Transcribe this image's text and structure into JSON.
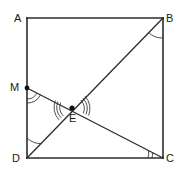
{
  "figure": {
    "kind": "plane-geometry-diagram",
    "shape": "square",
    "canvas": {
      "width": 179,
      "height": 175,
      "background": "#ffffff"
    },
    "stroke_color": "#2b2b2b",
    "arc_color": "#3a3a3a",
    "label_color": "#1a1a1a",
    "points": [
      {
        "id": "A",
        "label": "A",
        "x": 27,
        "y": 18,
        "label_x": 14,
        "label_y": 22,
        "marker": false
      },
      {
        "id": "B",
        "label": "B",
        "x": 163,
        "y": 18,
        "label_x": 166,
        "label_y": 22,
        "marker": false
      },
      {
        "id": "C",
        "label": "C",
        "x": 163,
        "y": 158,
        "label_x": 166,
        "label_y": 162,
        "marker": false
      },
      {
        "id": "D",
        "label": "D",
        "x": 27,
        "y": 158,
        "label_x": 12,
        "label_y": 162,
        "marker": false
      },
      {
        "id": "M",
        "label": "M",
        "x": 27,
        "y": 88,
        "label_x": 10,
        "label_y": 91,
        "marker": true
      },
      {
        "id": "E",
        "label": "E",
        "x": 72,
        "y": 108,
        "label_x": 69,
        "label_y": 122,
        "marker": true
      }
    ],
    "square_sides": [
      {
        "id": "AB",
        "from": "A",
        "to": "B"
      },
      {
        "id": "BC",
        "from": "B",
        "to": "C"
      },
      {
        "id": "CD",
        "from": "C",
        "to": "D"
      },
      {
        "id": "DA",
        "from": "D",
        "to": "A"
      }
    ],
    "segments": [
      {
        "id": "BD",
        "from": "B",
        "to": "D",
        "note": "diagonal"
      },
      {
        "id": "MC",
        "from": "M",
        "to": "C",
        "note": "cevian through E"
      }
    ],
    "angle_marks": [
      {
        "id": "angle-B",
        "at": "B",
        "arcs": 1,
        "note": "angle DBC"
      },
      {
        "id": "angle-D",
        "at": "D",
        "arcs": 1,
        "note": "angle BDA"
      },
      {
        "id": "angle-M",
        "at": "M",
        "arcs": 2,
        "note": "angle at M between MD and MC"
      },
      {
        "id": "angle-C",
        "at": "C",
        "arcs": 2,
        "note": "angle MCD"
      },
      {
        "id": "angle-E-left",
        "at": "E",
        "arcs": 3,
        "note": "angle DEM at E, left side"
      },
      {
        "id": "angle-E-right",
        "at": "E",
        "arcs": 3,
        "note": "angle BEC at E, right side"
      }
    ]
  }
}
